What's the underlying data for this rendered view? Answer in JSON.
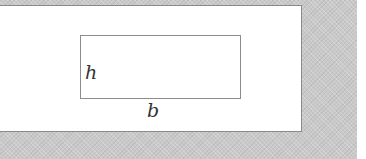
{
  "diagram": {
    "labels": {
      "height": "h",
      "base": "b"
    },
    "colors": {
      "background": "#c9c9c9",
      "panel": "#ffffff",
      "stroke": "#8c8c8c",
      "text": "#333333"
    }
  }
}
